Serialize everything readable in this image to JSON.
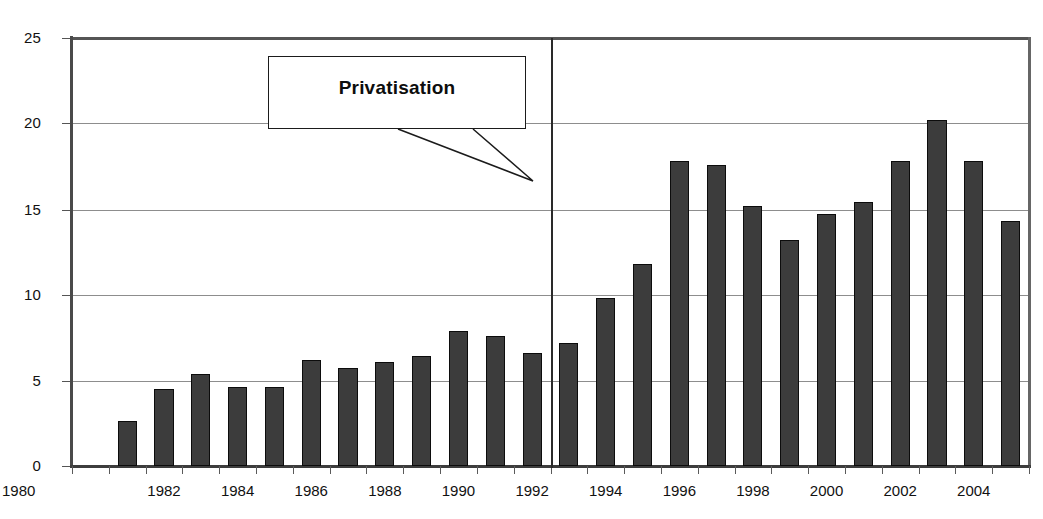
{
  "chart_data": {
    "type": "bar",
    "title": "",
    "xlabel": "",
    "ylabel": "",
    "ylim": [
      0,
      25
    ],
    "xlim": [
      1980,
      2006
    ],
    "grid": true,
    "legend": null,
    "categories": [
      "1981",
      "1982",
      "1983",
      "1984",
      "1985",
      "1986",
      "1987",
      "1988",
      "1989",
      "1990",
      "1991",
      "1992",
      "1993",
      "1994",
      "1995",
      "1996",
      "1997",
      "1998",
      "1999",
      "2000",
      "2001",
      "2002",
      "2003",
      "2004",
      "2005"
    ],
    "values": [
      2.6,
      4.5,
      5.4,
      4.6,
      4.6,
      6.2,
      5.7,
      6.1,
      6.4,
      7.9,
      7.6,
      6.6,
      7.2,
      9.8,
      11.8,
      17.8,
      17.6,
      15.2,
      13.2,
      14.7,
      15.4,
      17.8,
      20.2,
      17.8,
      14.3
    ],
    "ytick_labels": [
      "25",
      "20",
      "15",
      "10",
      "5",
      "0"
    ],
    "ytick_values": [
      25,
      20,
      15,
      10,
      5,
      0
    ],
    "xtick_labels": [
      "1980",
      "1982",
      "1984",
      "1986",
      "1988",
      "1990",
      "1992",
      "1994",
      "1996",
      "1998",
      "2000",
      "2002",
      "2004"
    ],
    "xtick_values": [
      1980,
      1982,
      1984,
      1986,
      1988,
      1990,
      1992,
      1994,
      1996,
      1998,
      2000,
      2002,
      2004
    ],
    "annotations": [
      {
        "name": "privatisation-callout",
        "text": "Privatisation",
        "points_to_year": 1993,
        "type": "callout-box-with-tail"
      },
      {
        "name": "privatisation-event-line",
        "text": "",
        "at_year": 1993,
        "type": "vertical-line"
      }
    ],
    "colors": {
      "bar_fill": "#3c3c3c",
      "bar_stroke": "#0c0c0c",
      "gridline": "#8d8d8d",
      "axis": "#4a4a4a",
      "text": "#111111",
      "callout_border": "#1b1b1b",
      "callout_background": "#ffffff",
      "event_line": "#2a2a2a"
    }
  },
  "axis": {
    "origin_label": "1980",
    "zero_label": "0"
  },
  "callout": {
    "label": "Privatisation"
  }
}
